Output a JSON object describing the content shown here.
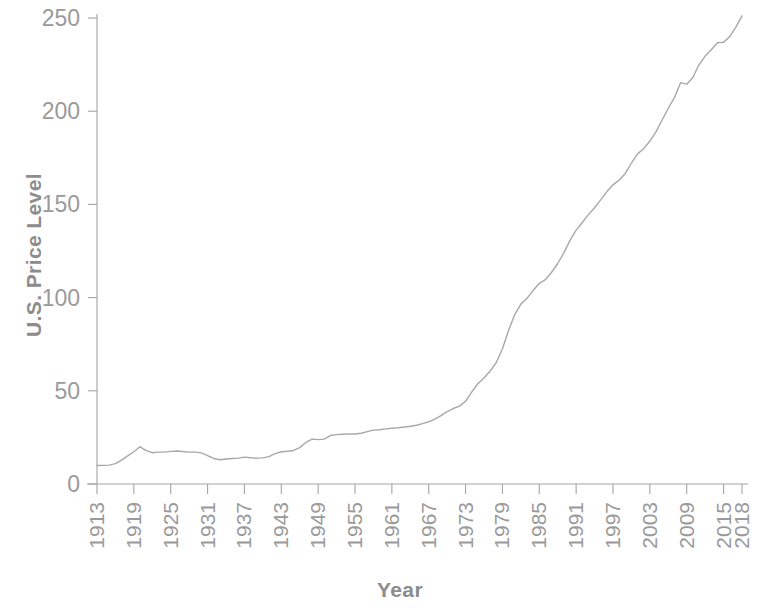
{
  "chart_data": {
    "type": "line",
    "title": "",
    "xlabel": "Year",
    "ylabel": "U.S. Price Level",
    "xlim": [
      1913,
      2018
    ],
    "ylim": [
      0,
      250
    ],
    "grid": false,
    "legend": null,
    "line_color": "#a8a8a8",
    "axis_color": "#a5a5a5",
    "text_color": "#9a9a9a",
    "background_color": "#ffffff",
    "ytick_labels": [
      "0",
      "50",
      "100",
      "150",
      "200",
      "250"
    ],
    "ytick_values": [
      0,
      50,
      100,
      150,
      200,
      250
    ],
    "xtick_labels": [
      "1913",
      "1919",
      "1925",
      "1931",
      "1937",
      "1943",
      "1949",
      "1955",
      "1961",
      "1967",
      "1973",
      "1979",
      "1985",
      "1991",
      "1997",
      "2003",
      "2009",
      "2015",
      "2018"
    ],
    "xtick_values": [
      1913,
      1919,
      1925,
      1931,
      1937,
      1943,
      1949,
      1955,
      1961,
      1967,
      1973,
      1979,
      1985,
      1991,
      1997,
      2003,
      2009,
      2015,
      2018
    ],
    "x": [
      1913,
      1914,
      1915,
      1916,
      1917,
      1918,
      1919,
      1920,
      1921,
      1922,
      1923,
      1924,
      1925,
      1926,
      1927,
      1928,
      1929,
      1930,
      1931,
      1932,
      1933,
      1934,
      1935,
      1936,
      1937,
      1938,
      1939,
      1940,
      1941,
      1942,
      1943,
      1944,
      1945,
      1946,
      1947,
      1948,
      1949,
      1950,
      1951,
      1952,
      1953,
      1954,
      1955,
      1956,
      1957,
      1958,
      1959,
      1960,
      1961,
      1962,
      1963,
      1964,
      1965,
      1966,
      1967,
      1968,
      1969,
      1970,
      1971,
      1972,
      1973,
      1974,
      1975,
      1976,
      1977,
      1978,
      1979,
      1980,
      1981,
      1982,
      1983,
      1984,
      1985,
      1986,
      1987,
      1988,
      1989,
      1990,
      1991,
      1992,
      1993,
      1994,
      1995,
      1996,
      1997,
      1998,
      1999,
      2000,
      2001,
      2002,
      2003,
      2004,
      2005,
      2006,
      2007,
      2008,
      2009,
      2010,
      2011,
      2012,
      2013,
      2014,
      2015,
      2016,
      2017,
      2018
    ],
    "y": [
      9.9,
      10.0,
      10.1,
      10.9,
      12.8,
      15.1,
      17.3,
      20.0,
      17.9,
      16.8,
      17.1,
      17.1,
      17.5,
      17.7,
      17.4,
      17.1,
      17.1,
      16.7,
      15.2,
      13.7,
      13.0,
      13.4,
      13.7,
      13.9,
      14.4,
      14.1,
      13.9,
      14.0,
      14.7,
      16.3,
      17.3,
      17.6,
      18.0,
      19.5,
      22.3,
      24.1,
      23.8,
      24.1,
      26.0,
      26.5,
      26.7,
      26.9,
      26.8,
      27.2,
      28.1,
      28.9,
      29.1,
      29.6,
      29.9,
      30.2,
      30.6,
      31.0,
      31.5,
      32.4,
      33.4,
      34.8,
      36.7,
      38.8,
      40.5,
      41.8,
      44.4,
      49.3,
      53.8,
      56.9,
      60.6,
      65.2,
      72.6,
      82.4,
      90.9,
      96.5,
      99.6,
      103.9,
      107.6,
      109.6,
      113.6,
      118.3,
      124.0,
      130.7,
      136.2,
      140.3,
      144.5,
      148.2,
      152.4,
      156.9,
      160.5,
      163.0,
      166.6,
      172.2,
      177.1,
      179.9,
      184.0,
      188.9,
      195.3,
      201.6,
      207.3,
      215.3,
      214.5,
      218.1,
      224.9,
      229.6,
      233.0,
      236.7,
      237.0,
      240.0,
      245.1,
      251.1
    ]
  },
  "axis_titles": {
    "y": "U.S. Price Level",
    "x": "Year"
  }
}
